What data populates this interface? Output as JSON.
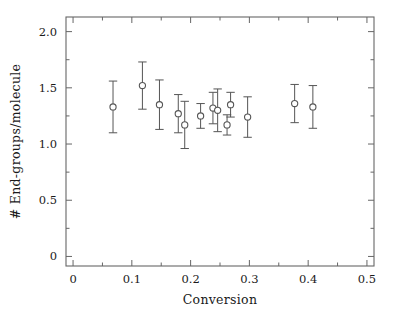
{
  "chart_data": {
    "type": "scatter",
    "title": "",
    "subtitle": "",
    "xlabel": "Conversion",
    "ylabel": "# End-groups/molecule",
    "xlim": [
      -0.012,
      0.512
    ],
    "ylim": [
      -0.085,
      2.13
    ],
    "grid": false,
    "legend": null,
    "marker": "open-circle",
    "error_bars": "vertical",
    "line_color": "#555555",
    "marker_edge_color": "#555555",
    "marker_face_color": "#ffffff",
    "frame_color": "#666666",
    "x_major_ticks": [
      0,
      0.1,
      0.2,
      0.3,
      0.4,
      0.5
    ],
    "x_major_tick_labels": [
      "0",
      "0.1",
      "0.2",
      "0.3",
      "0.4",
      "0.5"
    ],
    "x_minor_ticks": [
      0.05,
      0.15,
      0.25,
      0.35,
      0.45
    ],
    "y_major_ticks": [
      0,
      0.5,
      1.0,
      1.5,
      2.0
    ],
    "y_major_tick_labels": [
      "0",
      "0.5",
      "1.0",
      "1.5",
      "2.0"
    ],
    "y_minor_ticks": [
      0.25,
      0.75,
      1.25,
      1.75
    ],
    "x": [
      0.068,
      0.118,
      0.147,
      0.179,
      0.19,
      0.217,
      0.238,
      0.246,
      0.262,
      0.268,
      0.297,
      0.377,
      0.408
    ],
    "y": [
      1.33,
      1.52,
      1.35,
      1.27,
      1.17,
      1.25,
      1.32,
      1.3,
      1.17,
      1.35,
      1.24,
      1.36,
      1.33
    ],
    "yerr": [
      0.23,
      0.21,
      0.22,
      0.17,
      0.21,
      0.11,
      0.14,
      0.19,
      0.09,
      0.11,
      0.18,
      0.17,
      0.19
    ],
    "points": [
      {
        "x": 0.068,
        "y": 1.33,
        "yerr": 0.23
      },
      {
        "x": 0.118,
        "y": 1.52,
        "yerr": 0.21
      },
      {
        "x": 0.147,
        "y": 1.35,
        "yerr": 0.22
      },
      {
        "x": 0.179,
        "y": 1.27,
        "yerr": 0.17
      },
      {
        "x": 0.19,
        "y": 1.17,
        "yerr": 0.21
      },
      {
        "x": 0.217,
        "y": 1.25,
        "yerr": 0.11
      },
      {
        "x": 0.238,
        "y": 1.32,
        "yerr": 0.14
      },
      {
        "x": 0.246,
        "y": 1.3,
        "yerr": 0.19
      },
      {
        "x": 0.262,
        "y": 1.17,
        "yerr": 0.09
      },
      {
        "x": 0.268,
        "y": 1.35,
        "yerr": 0.11
      },
      {
        "x": 0.297,
        "y": 1.24,
        "yerr": 0.18
      },
      {
        "x": 0.377,
        "y": 1.36,
        "yerr": 0.17
      },
      {
        "x": 0.408,
        "y": 1.33,
        "yerr": 0.19
      }
    ]
  }
}
